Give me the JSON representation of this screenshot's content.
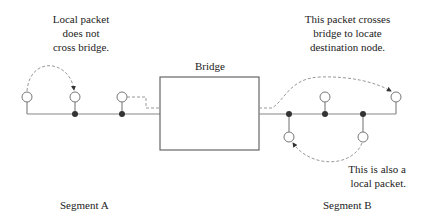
{
  "diagram": {
    "annotations": {
      "local_packet_a": [
        "Local packet",
        "does not",
        "cross bridge."
      ],
      "crossing_packet": [
        "This packet crosses",
        "bridge to locate",
        "destination node."
      ],
      "local_packet_b": [
        "This is also a",
        "local packet."
      ]
    },
    "bridge_label": "Bridge",
    "segments": {
      "a_label": "Segment A",
      "b_label": "Segment B"
    },
    "colors": {
      "line": "#888888",
      "dashed": "#999999",
      "node_fill": "#333333",
      "text": "#222222"
    }
  }
}
